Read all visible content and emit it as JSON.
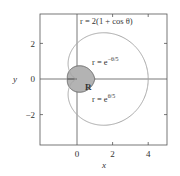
{
  "chart_data": {
    "type": "line",
    "title": "",
    "xlabel": "x",
    "ylabel": "y",
    "xlim": [
      -2,
      5
    ],
    "ylim": [
      -3.5,
      4
    ],
    "xticks": [
      "0",
      "2",
      "4"
    ],
    "yticks": [
      "2",
      "0",
      "−2"
    ],
    "grid": false,
    "series": [
      {
        "name": "cardioid",
        "label": "r = 2(1 + cos θ)",
        "equation": "r = 2(1 + cos theta)",
        "color": "#a8a8a8"
      },
      {
        "name": "spiral-neg",
        "label": "r = e^(−θ/5)",
        "equation": "r = e^(-theta/5)",
        "color": "#777777"
      },
      {
        "name": "spiral-pos",
        "label": "r = e^(θ/5)",
        "equation": "r = e^(theta/5)",
        "color": "#777777"
      }
    ],
    "annotations": [
      {
        "text": "R",
        "description": "shaded region bounded by the two exponential curves",
        "fill": "#b3b3b3"
      }
    ]
  },
  "labels": {
    "cardioid": "r = 2(1 + cos θ)",
    "r_neg_base": "r = e",
    "r_neg_exp": "−θ/5",
    "r_pos_base": "r = e",
    "r_pos_exp": "θ/5",
    "region": "R",
    "xlabel": "x",
    "ylabel": "y",
    "xtick0": "0",
    "xtick2": "2",
    "xtick4": "4",
    "ytick2": "2",
    "ytick0": "0",
    "ytickm2": "−2"
  }
}
